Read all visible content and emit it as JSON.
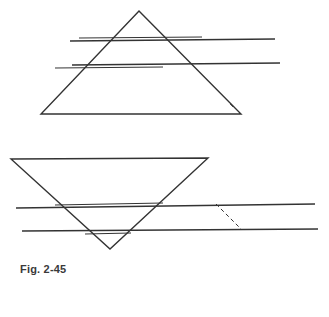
{
  "figure": {
    "caption": "Fig. 2-45",
    "stroke_color": "#333333",
    "background": "#ffffff"
  },
  "diagram": {
    "upright_prism": {
      "apex": [
        139,
        11
      ],
      "base_left": [
        41,
        114
      ],
      "base_right": [
        241,
        114
      ],
      "rays": [
        {
          "outer": [
            [
              70,
              41
            ],
            [
              275,
              39
            ]
          ],
          "inner": [
            [
              79,
              38
            ],
            [
              202,
              37
            ]
          ]
        },
        {
          "outer": [
            [
              72,
              65
            ],
            [
              280,
              63
            ]
          ],
          "inner": [
            [
              55,
              68
            ],
            [
              163,
              67
            ]
          ]
        }
      ],
      "mark": [
        [
          230,
          104
        ],
        [
          233,
          107
        ]
      ]
    },
    "inverted_prism": {
      "top_left": [
        11,
        159
      ],
      "top_right": [
        208,
        158
      ],
      "apex": [
        110,
        249
      ],
      "rays": [
        {
          "outer": [
            [
              16,
              208
            ],
            [
              315,
              204
            ]
          ],
          "inner": [
            [
              55,
              205
            ],
            [
              163,
              203
            ]
          ]
        },
        {
          "outer": [
            [
              22,
              231
            ],
            [
              318,
              229
            ]
          ],
          "inner": [
            [
              85,
              234
            ],
            [
              131,
              233
            ]
          ]
        }
      ],
      "dashed_segment": [
        [
          216,
          204
        ],
        [
          241,
          229
        ]
      ]
    }
  }
}
